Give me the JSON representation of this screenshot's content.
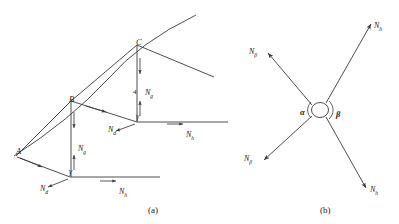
{
  "figure": {
    "panels": [
      {
        "id": "a",
        "caption": "(a)",
        "caption_x": 148,
        "caption_y": 205,
        "points": [
          {
            "name": "A",
            "label": "A",
            "x": 16,
            "y": 147
          },
          {
            "name": "B",
            "label": "B",
            "x": 69,
            "y": 95
          },
          {
            "name": "C",
            "label": "C",
            "x": 136,
            "y": 38
          }
        ],
        "angle_labels": [
          {
            "name": "gamma-lower",
            "label": "γ",
            "x": 69,
            "y": 168
          },
          {
            "name": "gamma-upper",
            "label": "γ",
            "x": 136,
            "y": 113
          }
        ],
        "numeric_labels": [
          {
            "name": "tick-4",
            "label": "4",
            "x": 133,
            "y": 89
          }
        ],
        "force_labels": [
          {
            "name": "force-nd-lower",
            "base": "N",
            "sub": "d",
            "x": 40,
            "y": 185
          },
          {
            "name": "force-ng-lower",
            "base": "N",
            "sub": "g",
            "x": 78,
            "y": 145
          },
          {
            "name": "force-nh-lower",
            "base": "N",
            "sub": "h",
            "x": 119,
            "y": 188
          },
          {
            "name": "force-nd-upper",
            "base": "N",
            "sub": "d",
            "x": 108,
            "y": 126
          },
          {
            "name": "force-ng-upper",
            "base": "N",
            "sub": "g",
            "x": 145,
            "y": 89
          },
          {
            "name": "force-nh-upper",
            "base": "N",
            "sub": "h",
            "x": 186,
            "y": 131
          }
        ]
      },
      {
        "id": "b",
        "caption": "(b)",
        "caption_x": 320,
        "caption_y": 205,
        "angle_labels": [
          {
            "name": "angle-alpha",
            "label": "α",
            "x": 300,
            "y": 108
          },
          {
            "name": "angle-beta",
            "label": "β",
            "x": 336,
            "y": 110
          }
        ],
        "force_labels": [
          {
            "name": "force-nh-top-right",
            "base": "N",
            "sub": "h",
            "x": 374,
            "y": 22
          },
          {
            "name": "force-nbeta-top-left",
            "base": "N",
            "sub": "β",
            "x": 249,
            "y": 48
          },
          {
            "name": "force-nbeta-bottom-left",
            "base": "N",
            "sub": "β",
            "x": 244,
            "y": 155
          },
          {
            "name": "force-nh-bottom-right",
            "base": "N",
            "sub": "h",
            "x": 370,
            "y": 186
          }
        ]
      }
    ],
    "colors": {
      "stroke": "#3a3a3a",
      "text": "#1a1a1a",
      "background": "#ffffff"
    }
  }
}
